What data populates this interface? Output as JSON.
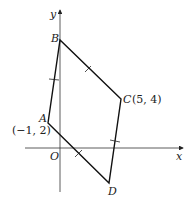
{
  "diagram": {
    "axes": {
      "x_label": "x",
      "y_label": "y",
      "origin_label": "O"
    },
    "points": {
      "A": {
        "label": "A",
        "coords": "(−1, 2)"
      },
      "B": {
        "label": "B"
      },
      "C": {
        "label": "C",
        "coords": "(5, 4)"
      },
      "D": {
        "label": "D"
      }
    },
    "shape": "parallelogram ABCD with equal-side tick marks on AB, BC, CD, DA"
  }
}
